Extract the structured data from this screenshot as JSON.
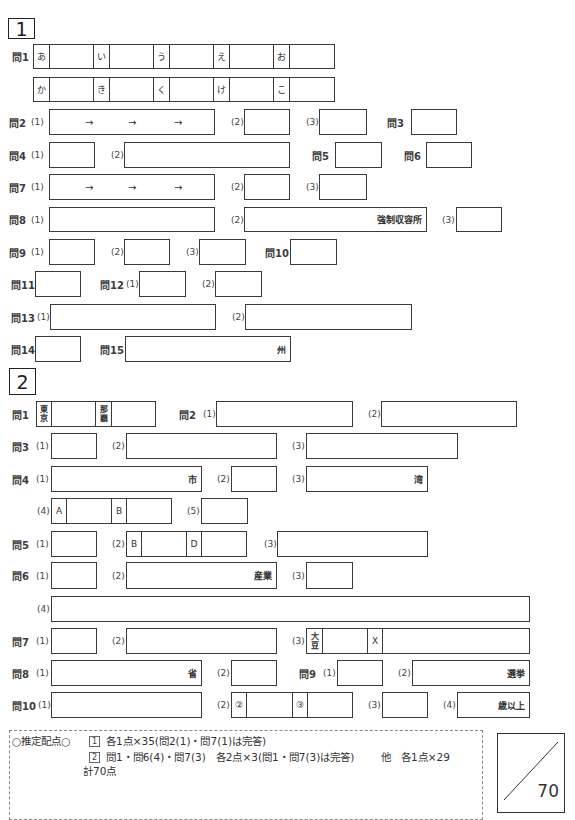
{
  "sub": {
    "1": "(1)",
    "2": "(2)",
    "3": "(3)",
    "4": "(4)",
    "5": "(5)"
  },
  "section1": {
    "number": "1",
    "q1": {
      "label": "問1",
      "row1": [
        "あ",
        "い",
        "う",
        "え",
        "お"
      ],
      "row2": [
        "か",
        "き",
        "く",
        "け",
        "こ"
      ]
    },
    "q2": {
      "label": "問2",
      "arrow": "→"
    },
    "q3": {
      "label": "問3"
    },
    "q4": {
      "label": "問4"
    },
    "q5": {
      "label": "問5"
    },
    "q6": {
      "label": "問6"
    },
    "q7": {
      "label": "問7",
      "arrow": "→"
    },
    "q8": {
      "label": "問8",
      "suffix_2": "強制収容所"
    },
    "q9": {
      "label": "問9"
    },
    "q10": {
      "label": "問10"
    },
    "q11": {
      "label": "問11"
    },
    "q12": {
      "label": "問12"
    },
    "q13": {
      "label": "問13"
    },
    "q14": {
      "label": "問14"
    },
    "q15": {
      "label": "問15",
      "suffix": "州"
    }
  },
  "section2": {
    "number": "2",
    "q1": {
      "label": "問1",
      "cell_a": "東京",
      "cell_b": "那覇"
    },
    "q2": {
      "label": "問2"
    },
    "q3": {
      "label": "問3"
    },
    "q4": {
      "label": "問4",
      "suffix_1": "市",
      "suffix_3": "湾",
      "cell_a": "A",
      "cell_b": "B"
    },
    "q5": {
      "label": "問5",
      "cell_b": "B",
      "cell_d": "D"
    },
    "q6": {
      "label": "問6",
      "suffix_2": "産業"
    },
    "q7": {
      "label": "問7",
      "cell_soy": "大豆",
      "cell_x": "X"
    },
    "q8": {
      "label": "問8",
      "suffix_1": "省"
    },
    "q9": {
      "label": "問9",
      "suffix_2": "選挙"
    },
    "q10": {
      "label": "問10",
      "cell_2": "②",
      "cell_3": "③",
      "suffix_4": "歳以上"
    }
  },
  "scoring": {
    "heading": "○推定配点○",
    "line1_mark": "1",
    "line1_text": "各1点×35(問2(1)・問7(1)は完答)",
    "line2_mark": "2",
    "line2_text": "問1・問6(4)・問7(3)　各2点×3(問1・問7(3)は完答)",
    "line2_other": "他　各1点×29",
    "total": "計70点"
  },
  "score_box": {
    "max": "70"
  }
}
